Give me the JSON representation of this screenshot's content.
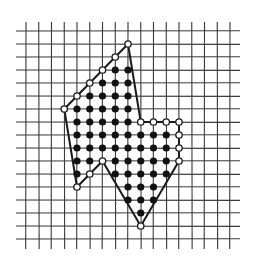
{
  "diagram": {
    "type": "lattice-polygon",
    "colors": {
      "background": "#ffffff",
      "grid_line": "#3a3a3a",
      "polygon_edge": "#1a1a1a",
      "interior_dot": "#111111",
      "boundary_dot_fill": "#ffffff",
      "boundary_dot_stroke": "#1a1a1a"
    },
    "grid": {
      "columns": 17,
      "rows": 17,
      "origin_x": 26,
      "origin_y": 31,
      "spacing_x": 12.75,
      "spacing_y": 13,
      "vertical_line_extent": [
        22,
        249
      ],
      "horizontal_line_extent": [
        16,
        240
      ]
    },
    "polygon_vertices": [
      [
        8,
        1
      ],
      [
        9,
        7
      ],
      [
        12,
        7
      ],
      [
        12,
        10
      ],
      [
        9,
        15
      ],
      [
        6,
        10
      ],
      [
        4,
        12
      ],
      [
        3,
        6
      ]
    ],
    "boundary_points": [
      [
        8,
        1
      ],
      [
        7,
        2
      ],
      [
        6,
        3
      ],
      [
        5,
        4
      ],
      [
        4,
        5
      ],
      [
        3,
        6
      ],
      [
        9,
        7
      ],
      [
        10,
        7
      ],
      [
        11,
        7
      ],
      [
        12,
        7
      ],
      [
        12,
        8
      ],
      [
        12,
        9
      ],
      [
        12,
        10
      ],
      [
        9,
        15
      ],
      [
        6,
        10
      ],
      [
        5,
        11
      ],
      [
        4,
        12
      ]
    ],
    "interior_points_by_row": {
      "3": [
        7,
        8
      ],
      "4": [
        6,
        7,
        8
      ],
      "5": [
        5,
        6,
        7,
        8
      ],
      "6": [
        4,
        5,
        6,
        7,
        8
      ],
      "7": [
        4,
        5,
        6,
        7,
        8
      ],
      "8": [
        4,
        5,
        6,
        7,
        8,
        9,
        10,
        11
      ],
      "9": [
        4,
        5,
        6,
        7,
        8,
        9,
        10,
        11
      ],
      "10": [
        4,
        5,
        7,
        8,
        9,
        10,
        11
      ],
      "11": [
        4,
        7,
        8,
        9,
        10,
        11
      ],
      "12": [
        8,
        9,
        10
      ],
      "13": [
        8,
        9,
        10
      ],
      "14": [
        9
      ]
    },
    "counts": {
      "boundary_points": 17,
      "interior_points": 58
    }
  }
}
